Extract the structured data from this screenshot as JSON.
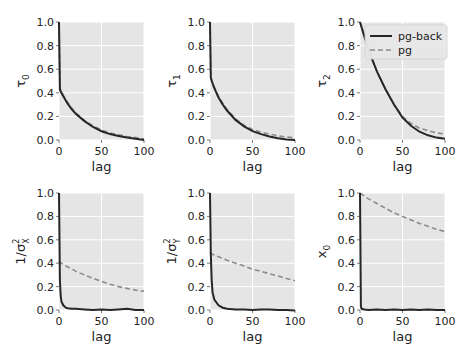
{
  "figure": {
    "rows": 2,
    "cols": 3,
    "background": "#ffffff",
    "axes_facecolor": "#e5e5e5",
    "grid_color": "#ffffff"
  },
  "legend": {
    "panel_index": 2,
    "entries": [
      {
        "label": "pg-back",
        "style": "solid",
        "color": "#262626"
      },
      {
        "label": "pg",
        "style": "dashed",
        "color": "#8c8c8c"
      }
    ]
  },
  "chart_data": [
    {
      "type": "line",
      "ylabel": "τ0",
      "ylabel_main": "τ",
      "ylabel_sub": "0",
      "xlabel": "lag",
      "xlim": [
        0,
        100
      ],
      "ylim": [
        0,
        1
      ],
      "xticks": [
        "0",
        "50",
        "100"
      ],
      "yticks": [
        "0.0",
        "0.2",
        "0.4",
        "0.6",
        "0.8",
        "1.0"
      ],
      "grid": true,
      "x": [
        0,
        1,
        2,
        5,
        10,
        15,
        20,
        30,
        40,
        50,
        60,
        70,
        80,
        90,
        100
      ],
      "series": [
        {
          "name": "pg-back",
          "values": [
            1.0,
            0.43,
            0.41,
            0.37,
            0.31,
            0.26,
            0.22,
            0.16,
            0.11,
            0.075,
            0.05,
            0.035,
            0.02,
            0.01,
            0.0
          ]
        },
        {
          "name": "pg",
          "values": [
            1.0,
            0.44,
            0.42,
            0.38,
            0.32,
            0.27,
            0.23,
            0.165,
            0.12,
            0.085,
            0.06,
            0.045,
            0.03,
            0.02,
            0.01
          ]
        }
      ]
    },
    {
      "type": "line",
      "ylabel": "τ1",
      "ylabel_main": "τ",
      "ylabel_sub": "1",
      "xlabel": "lag",
      "xlim": [
        0,
        100
      ],
      "ylim": [
        0,
        1
      ],
      "xticks": [
        "0",
        "50",
        "100"
      ],
      "yticks": [
        "0.0",
        "0.2",
        "0.4",
        "0.6",
        "0.8",
        "1.0"
      ],
      "grid": true,
      "x": [
        0,
        1,
        2,
        5,
        10,
        15,
        20,
        30,
        40,
        50,
        60,
        70,
        80,
        90,
        100
      ],
      "series": [
        {
          "name": "pg-back",
          "values": [
            1.0,
            0.53,
            0.5,
            0.44,
            0.36,
            0.3,
            0.25,
            0.17,
            0.115,
            0.075,
            0.05,
            0.03,
            0.015,
            0.005,
            0.0
          ]
        },
        {
          "name": "pg",
          "values": [
            1.0,
            0.54,
            0.51,
            0.45,
            0.37,
            0.31,
            0.26,
            0.18,
            0.125,
            0.09,
            0.065,
            0.05,
            0.035,
            0.025,
            0.02
          ]
        }
      ]
    },
    {
      "type": "line",
      "ylabel": "τ2",
      "ylabel_main": "τ",
      "ylabel_sub": "2",
      "xlabel": "lag",
      "xlim": [
        0,
        100
      ],
      "ylim": [
        0,
        1
      ],
      "xticks": [
        "0",
        "50",
        "100"
      ],
      "yticks": [
        "0.0",
        "0.2",
        "0.4",
        "0.6",
        "0.8",
        "1.0"
      ],
      "grid": true,
      "x": [
        0,
        5,
        10,
        15,
        20,
        30,
        40,
        50,
        60,
        70,
        80,
        90,
        100
      ],
      "series": [
        {
          "name": "pg-back",
          "values": [
            1.0,
            0.88,
            0.77,
            0.67,
            0.58,
            0.43,
            0.3,
            0.19,
            0.12,
            0.07,
            0.04,
            0.02,
            0.01
          ]
        },
        {
          "name": "pg",
          "values": [
            1.0,
            0.88,
            0.77,
            0.67,
            0.58,
            0.43,
            0.3,
            0.2,
            0.14,
            0.1,
            0.08,
            0.06,
            0.05
          ]
        }
      ]
    },
    {
      "type": "line",
      "ylabel": "1/σ²X",
      "ylabel_main": "1/σ",
      "ylabel_sub": "X",
      "ylabel_sup": "2",
      "xlabel": "lag",
      "xlim": [
        0,
        100
      ],
      "ylim": [
        0,
        1
      ],
      "xticks": [
        "0",
        "50",
        "100"
      ],
      "yticks": [
        "0.0",
        "0.2",
        "0.4",
        "0.6",
        "0.8",
        "1.0"
      ],
      "grid": true,
      "x": [
        0,
        1,
        2,
        3,
        5,
        8,
        10,
        15,
        20,
        30,
        40,
        50,
        60,
        70,
        80,
        90,
        100
      ],
      "series": [
        {
          "name": "pg-back",
          "values": [
            1.0,
            0.25,
            0.12,
            0.07,
            0.04,
            0.02,
            0.015,
            0.01,
            0.01,
            0.005,
            0.0,
            0.005,
            0.0,
            0.005,
            0.01,
            0.0,
            0.0
          ]
        },
        {
          "name": "pg",
          "values": [
            0.42,
            0.41,
            0.405,
            0.4,
            0.39,
            0.375,
            0.37,
            0.35,
            0.33,
            0.3,
            0.27,
            0.245,
            0.22,
            0.2,
            0.185,
            0.17,
            0.16
          ]
        }
      ]
    },
    {
      "type": "line",
      "ylabel": "1/σ²Y",
      "ylabel_main": "1/σ",
      "ylabel_sub": "Y",
      "ylabel_sup": "2",
      "xlabel": "lag",
      "xlim": [
        0,
        100
      ],
      "ylim": [
        0,
        1
      ],
      "xticks": [
        "0",
        "50",
        "100"
      ],
      "yticks": [
        "0.0",
        "0.2",
        "0.4",
        "0.6",
        "0.8",
        "1.0"
      ],
      "grid": true,
      "x": [
        0,
        1,
        2,
        3,
        5,
        8,
        10,
        15,
        20,
        30,
        40,
        50,
        60,
        70,
        80,
        90,
        100
      ],
      "series": [
        {
          "name": "pg-back",
          "values": [
            1.0,
            0.48,
            0.25,
            0.15,
            0.09,
            0.06,
            0.04,
            0.02,
            0.01,
            0.005,
            0.005,
            0.0,
            0.005,
            0.005,
            0.0,
            0.0,
            -0.005
          ]
        },
        {
          "name": "pg",
          "values": [
            0.49,
            0.485,
            0.48,
            0.475,
            0.47,
            0.46,
            0.455,
            0.44,
            0.425,
            0.4,
            0.375,
            0.35,
            0.33,
            0.31,
            0.29,
            0.27,
            0.25
          ]
        }
      ]
    },
    {
      "type": "line",
      "ylabel": "x0",
      "ylabel_main": "x",
      "ylabel_sub": "0",
      "xlabel": "lag",
      "xlim": [
        0,
        100
      ],
      "ylim": [
        0,
        1
      ],
      "xticks": [
        "0",
        "50",
        "100"
      ],
      "yticks": [
        "0.0",
        "0.2",
        "0.4",
        "0.6",
        "0.8",
        "1.0"
      ],
      "grid": true,
      "x": [
        0,
        1,
        2,
        5,
        10,
        20,
        30,
        40,
        50,
        60,
        70,
        80,
        90,
        100
      ],
      "series": [
        {
          "name": "pg-back",
          "values": [
            1.0,
            0.03,
            0.01,
            0.005,
            0.0,
            0.005,
            0.0,
            0.005,
            0.0,
            0.005,
            0.0,
            0.005,
            0.0,
            0.0
          ]
        },
        {
          "name": "pg",
          "values": [
            1.0,
            0.995,
            0.99,
            0.975,
            0.95,
            0.91,
            0.87,
            0.83,
            0.8,
            0.77,
            0.74,
            0.715,
            0.69,
            0.67
          ]
        }
      ]
    }
  ]
}
